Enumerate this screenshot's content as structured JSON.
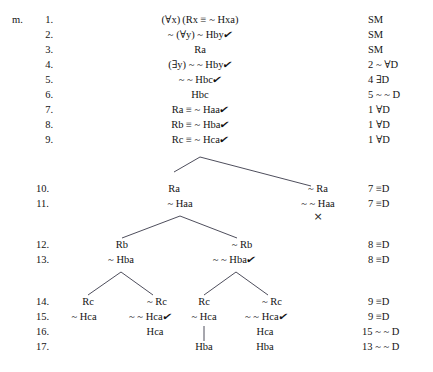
{
  "margin_label": "m.",
  "symbols": {
    "check": "✔",
    "closed": "×",
    "forall": "∀",
    "exists": "∃",
    "triple_bar": "≡",
    "tilde": "~"
  },
  "line_numbers": [
    "1.",
    "2.",
    "3.",
    "4.",
    "5.",
    "6.",
    "7.",
    "8.",
    "9.",
    "10.",
    "11.",
    "12.",
    "13.",
    "14.",
    "15.",
    "16.",
    "17."
  ],
  "trunk": [
    {
      "line": "1.",
      "formula": "(∀x) (Rx ≡ ~ Hxa)",
      "checked": false,
      "justification": "SM"
    },
    {
      "line": "2.",
      "formula": "~ (∀y) ~ Hby",
      "checked": true,
      "justification": "SM"
    },
    {
      "line": "3.",
      "formula": "Ra",
      "checked": false,
      "justification": "SM"
    },
    {
      "line": "4.",
      "formula": "(∃y) ~ ~ Hby",
      "checked": true,
      "justification": "2 ~ ∀D"
    },
    {
      "line": "5.",
      "formula": "~ ~ Hbc",
      "checked": true,
      "justification": "4 ∃D"
    },
    {
      "line": "6.",
      "formula": "Hbc",
      "checked": false,
      "justification": "5 ~ ~ D"
    },
    {
      "line": "7.",
      "formula": "Ra ≡ ~ Haa",
      "checked": true,
      "justification": "1 ∀D"
    },
    {
      "line": "8.",
      "formula": "Rb ≡ ~ Hba",
      "checked": true,
      "justification": "1 ∀D"
    },
    {
      "line": "9.",
      "formula": "Rc ≡ ~ Hca",
      "checked": true,
      "justification": "1 ∀D"
    }
  ],
  "branch_rows": [
    {
      "line": "10.",
      "justification": "7 ≡D"
    },
    {
      "line": "11.",
      "justification": "7 ≡D"
    },
    {
      "line": "12.",
      "justification": "8 ≡D"
    },
    {
      "line": "13.",
      "justification": "8 ≡D"
    },
    {
      "line": "14.",
      "justification": "9 ≡D"
    },
    {
      "line": "15.",
      "justification": "9 ≡D"
    },
    {
      "line": "16.",
      "justification": "15 ~ ~ D"
    },
    {
      "line": "17.",
      "justification": "13 ~ ~ D"
    }
  ],
  "nodes": {
    "n10_left": "Ra",
    "n10_right": "~ Ra",
    "n11_left": "~ Haa",
    "n11_right": "~ ~ Haa",
    "n11_right_closed": "×",
    "n12_left": "Rb",
    "n12_right": "~ Rb",
    "n13_left": "~ Hba",
    "n13_right": "~ ~ Hba",
    "n14_c1": "Rc",
    "n14_c2": "~ Rc",
    "n14_c3": "Rc",
    "n14_c4": "~ Rc",
    "n15_c1": "~ Hca",
    "n15_c2": "~ ~ Hca",
    "n15_c3": "~ Hca",
    "n15_c4": "~ ~ Hca",
    "n16_c2": "Hca",
    "n16_c4": "Hca",
    "n17_c3": "Hba",
    "n17_c4": "Hba"
  }
}
